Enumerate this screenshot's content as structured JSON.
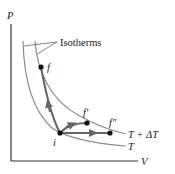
{
  "diagram": {
    "axes": {
      "y_label": "P",
      "x_label": "V"
    },
    "callout_label": "Isotherms",
    "isotherms": [
      {
        "name": "lower",
        "label": "T"
      },
      {
        "name": "upper",
        "label": "T + ΔT"
      }
    ],
    "points": {
      "initial": "i",
      "final_1": "f",
      "final_2": "f′",
      "final_3": "f″"
    },
    "colors": {
      "axis": "#333333",
      "isotherm": "#8a8a8a",
      "path": "#666666",
      "point": "#111111",
      "text": "#222222"
    }
  }
}
